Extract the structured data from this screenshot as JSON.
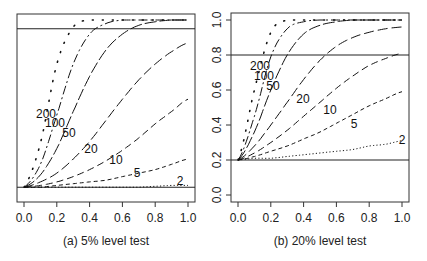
{
  "chart_data": [
    {
      "type": "line",
      "title": "(a) 5% level test",
      "xlabel": "",
      "ylabel": "",
      "xlim": [
        0,
        1
      ],
      "ylim": [
        0,
        1
      ],
      "x_ticks": [
        "0.0",
        "0.2",
        "0.4",
        "0.6",
        "0.8",
        "1.0"
      ],
      "y_ticks": [],
      "reference_lines": [
        0.05,
        0.95
      ],
      "x": [
        0,
        0.1,
        0.2,
        0.3,
        0.4,
        0.5,
        0.6,
        0.7,
        0.8,
        0.9,
        1.0
      ],
      "series": [
        {
          "name": "2",
          "style": "dotted",
          "values": [
            0.05,
            0.05,
            0.05,
            0.05,
            0.05,
            0.05,
            0.05,
            0.05,
            0.055,
            0.06,
            0.06
          ]
        },
        {
          "name": "5",
          "style": "dashed-short",
          "values": [
            0.05,
            0.05,
            0.06,
            0.07,
            0.08,
            0.09,
            0.11,
            0.13,
            0.15,
            0.18,
            0.21
          ]
        },
        {
          "name": "10",
          "style": "dashed",
          "values": [
            0.05,
            0.06,
            0.08,
            0.11,
            0.15,
            0.2,
            0.26,
            0.33,
            0.41,
            0.48,
            0.55
          ]
        },
        {
          "name": "20",
          "style": "dashed-long",
          "values": [
            0.05,
            0.08,
            0.13,
            0.21,
            0.31,
            0.43,
            0.55,
            0.66,
            0.75,
            0.82,
            0.87
          ]
        },
        {
          "name": "50",
          "style": "longdash",
          "values": [
            0.05,
            0.12,
            0.27,
            0.48,
            0.68,
            0.83,
            0.92,
            0.97,
            0.99,
            1.0,
            1.0
          ]
        },
        {
          "name": "100",
          "style": "dotdash",
          "values": [
            0.05,
            0.18,
            0.46,
            0.75,
            0.92,
            0.98,
            1.0,
            1.0,
            1.0,
            1.0,
            1.0
          ]
        },
        {
          "name": "200",
          "style": "dotted-sparse",
          "values": [
            0.05,
            0.3,
            0.75,
            0.96,
            1.0,
            1.0,
            1.0,
            1.0,
            1.0,
            1.0,
            1.0
          ]
        }
      ]
    },
    {
      "type": "line",
      "title": "(b) 20% level test",
      "xlabel": "",
      "ylabel": "",
      "xlim": [
        0,
        1
      ],
      "ylim": [
        0,
        1
      ],
      "x_ticks": [
        "0.0",
        "0.2",
        "0.4",
        "0.6",
        "0.8",
        "1.0"
      ],
      "y_ticks": [
        "0.0",
        "0.2",
        "0.4",
        "0.6",
        "0.8",
        "1.0"
      ],
      "reference_lines": [
        0.2,
        0.8
      ],
      "x": [
        0,
        0.1,
        0.2,
        0.3,
        0.4,
        0.5,
        0.6,
        0.7,
        0.8,
        0.9,
        1.0
      ],
      "series": [
        {
          "name": "2",
          "style": "dotted",
          "values": [
            0.2,
            0.21,
            0.21,
            0.22,
            0.23,
            0.24,
            0.25,
            0.26,
            0.28,
            0.29,
            0.31
          ]
        },
        {
          "name": "5",
          "style": "dashed-short",
          "values": [
            0.2,
            0.22,
            0.25,
            0.28,
            0.32,
            0.36,
            0.41,
            0.46,
            0.51,
            0.55,
            0.59
          ]
        },
        {
          "name": "10",
          "style": "dashed",
          "values": [
            0.2,
            0.24,
            0.3,
            0.37,
            0.45,
            0.53,
            0.61,
            0.68,
            0.74,
            0.78,
            0.81
          ]
        },
        {
          "name": "20",
          "style": "dashed-long",
          "values": [
            0.2,
            0.28,
            0.4,
            0.53,
            0.66,
            0.77,
            0.85,
            0.9,
            0.93,
            0.95,
            0.96
          ]
        },
        {
          "name": "50",
          "style": "longdash",
          "values": [
            0.2,
            0.36,
            0.6,
            0.8,
            0.92,
            0.97,
            0.99,
            1.0,
            1.0,
            1.0,
            1.0
          ]
        },
        {
          "name": "100",
          "style": "dotdash",
          "values": [
            0.2,
            0.45,
            0.79,
            0.95,
            0.99,
            1.0,
            1.0,
            1.0,
            1.0,
            1.0,
            1.0
          ]
        },
        {
          "name": "200",
          "style": "dotted-sparse",
          "values": [
            0.2,
            0.6,
            0.93,
            1.0,
            1.0,
            1.0,
            1.0,
            1.0,
            1.0,
            1.0,
            1.0
          ]
        }
      ]
    }
  ],
  "captions": {
    "left": "(a) 5% level test",
    "right": "(b) 20% level test"
  }
}
